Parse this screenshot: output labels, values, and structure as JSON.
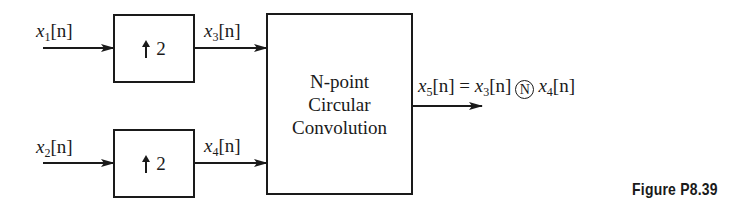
{
  "diagram": {
    "type": "block-diagram",
    "inputs": [
      {
        "id": "x1",
        "symbol": "x",
        "subscript": "1",
        "arg": "[n]"
      },
      {
        "id": "x2",
        "symbol": "x",
        "subscript": "2",
        "arg": "[n]"
      }
    ],
    "upsamplers": [
      {
        "id": "up-top",
        "factor": "2",
        "input": "x1",
        "output": "x3"
      },
      {
        "id": "up-bottom",
        "factor": "2",
        "input": "x2",
        "output": "x4"
      }
    ],
    "intermediate": [
      {
        "id": "x3",
        "symbol": "x",
        "subscript": "3",
        "arg": "[n]"
      },
      {
        "id": "x4",
        "symbol": "x",
        "subscript": "4",
        "arg": "[n]"
      }
    ],
    "convolution_block": {
      "lines": [
        "N-point",
        "Circular",
        "Convolution"
      ]
    },
    "output": {
      "lhs": {
        "symbol": "x",
        "subscript": "5",
        "arg": "[n]"
      },
      "equals": "=",
      "term1": {
        "symbol": "x",
        "subscript": "3",
        "arg": "[n]"
      },
      "operator": "N",
      "term2": {
        "symbol": "x",
        "subscript": "4",
        "arg": "[n]"
      }
    }
  },
  "caption": "Figure P8.39"
}
